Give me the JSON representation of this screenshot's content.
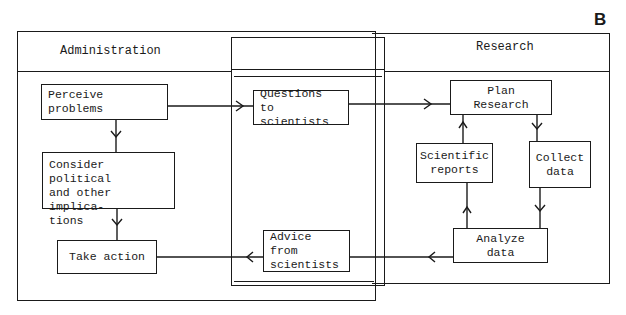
{
  "panel_label": "B",
  "lanes": {
    "administration": {
      "title": "Administration"
    },
    "research": {
      "title": "Research"
    },
    "interface": {
      "title": ""
    }
  },
  "nodes": {
    "perceive_problems": "Perceive problems",
    "consider_implications": "Consider political\nand other implica-\ntions",
    "take_action": "Take action",
    "questions_to_scientists": "Questions to\nscientists",
    "advice_from_scientists": "Advice from\nscientists",
    "plan_research": "Plan Research",
    "scientific_reports": "Scientific\nreports",
    "collect_data": "Collect\ndata",
    "analyze_data": "Analyze data"
  },
  "edges": [
    {
      "from": "Perceive problems",
      "to": "Questions to scientists"
    },
    {
      "from": "Perceive problems",
      "to": "Consider political and other implications"
    },
    {
      "from": "Consider political and other implications",
      "to": "Take action"
    },
    {
      "from": "Questions to scientists",
      "to": "Plan Research"
    },
    {
      "from": "Plan Research",
      "to": "Collect data"
    },
    {
      "from": "Collect data",
      "to": "Analyze data"
    },
    {
      "from": "Analyze data",
      "to": "Scientific reports"
    },
    {
      "from": "Scientific reports",
      "to": "Plan Research"
    },
    {
      "from": "Analyze data",
      "to": "Advice from scientists"
    },
    {
      "from": "Advice from scientists",
      "to": "Take action"
    }
  ],
  "colors": {
    "ink": "#1a1a1a",
    "background": "#ffffff"
  }
}
